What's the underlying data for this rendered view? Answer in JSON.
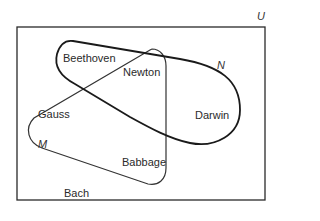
{
  "diagram": {
    "type": "venn",
    "universe_label": "U",
    "sets": [
      {
        "name": "N",
        "label": "N",
        "stroke": "#1a1a1a",
        "members": [
          "Beethoven",
          "Newton",
          "Darwin"
        ]
      },
      {
        "name": "M",
        "label": "M",
        "stroke": "#333333",
        "members": [
          "Gauss",
          "Newton",
          "Babbage"
        ]
      }
    ],
    "elements": {
      "beethoven": "Beethoven",
      "newton": "Newton",
      "gauss": "Gauss",
      "darwin": "Darwin",
      "babbage": "Babbage",
      "bach": "Bach"
    },
    "regions": {
      "N_only": [
        "Beethoven",
        "Darwin"
      ],
      "M_only": [
        "Gauss",
        "Babbage"
      ],
      "N_and_M": [
        "Newton"
      ],
      "neither": [
        "Bach"
      ]
    }
  }
}
